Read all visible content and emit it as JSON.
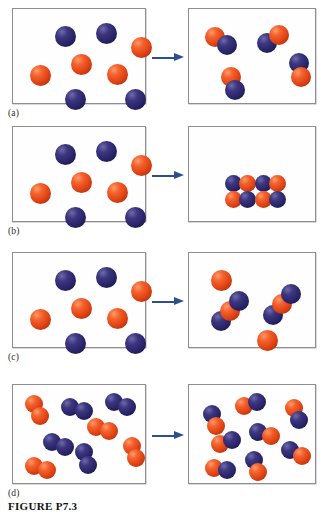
{
  "figure": {
    "caption": "FIGURE P7.3",
    "caption_font_style": "bold-serif",
    "background_color": "#ffffff",
    "box_border_color": "#8d8d93",
    "arrow_color": "#2d4f8e",
    "atom_colors": {
      "red": "#e04315",
      "blue": "#2a2568"
    },
    "atom_legend": [
      {
        "key": "red",
        "label": "red atom",
        "color": "#e04315"
      },
      {
        "key": "blue",
        "label": "blue atom",
        "color": "#2a2568"
      }
    ]
  },
  "panels": [
    {
      "id": "a",
      "label": "(a)",
      "arrow_label": "reacts to form",
      "reactants": {
        "box_name": "reactant-box-a",
        "description": "four free red atoms and four free blue atoms",
        "species": [
          {
            "formula": "red atom",
            "count": 4
          },
          {
            "formula": "blue atom",
            "count": 4
          }
        ],
        "atoms": [
          {
            "color": "blue",
            "x": 42,
            "y": 17,
            "r": 10.5
          },
          {
            "color": "blue",
            "x": 83,
            "y": 14,
            "r": 10.5
          },
          {
            "color": "red",
            "x": 118,
            "y": 28,
            "r": 10.5
          },
          {
            "color": "red",
            "x": 58,
            "y": 45,
            "r": 10.5
          },
          {
            "color": "red",
            "x": 17,
            "y": 56,
            "r": 10.5
          },
          {
            "color": "red",
            "x": 94,
            "y": 55,
            "r": 10.5
          },
          {
            "color": "blue",
            "x": 52,
            "y": 80,
            "r": 10.5
          },
          {
            "color": "blue",
            "x": 112,
            "y": 80,
            "r": 10.5
          }
        ]
      },
      "products": {
        "box_name": "product-box-a",
        "description": "four diatomic molecules, each one red atom bonded to one blue atom",
        "species": [
          {
            "formula": "red-blue diatomic molecule",
            "count": 4
          }
        ],
        "molecules": [
          {
            "type": "diatomic",
            "atoms": [
              {
                "color": "red",
                "x": 16,
                "y": 18,
                "r": 10
              },
              {
                "color": "blue",
                "x": 28,
                "y": 26,
                "r": 10
              }
            ]
          },
          {
            "type": "diatomic",
            "atoms": [
              {
                "color": "blue",
                "x": 68,
                "y": 24,
                "r": 10
              },
              {
                "color": "red",
                "x": 80,
                "y": 16,
                "r": 10
              }
            ]
          },
          {
            "type": "diatomic",
            "atoms": [
              {
                "color": "blue",
                "x": 100,
                "y": 44,
                "r": 10
              },
              {
                "color": "red",
                "x": 102,
                "y": 58,
                "r": 10
              }
            ]
          },
          {
            "type": "diatomic",
            "atoms": [
              {
                "color": "red",
                "x": 32,
                "y": 58,
                "r": 10
              },
              {
                "color": "blue",
                "x": 36,
                "y": 71,
                "r": 10
              }
            ]
          }
        ]
      }
    },
    {
      "id": "b",
      "label": "(b)",
      "arrow_label": "reacts to form",
      "reactants": {
        "box_name": "reactant-box-b",
        "description": "four free red atoms and four free blue atoms",
        "species": [
          {
            "formula": "red atom",
            "count": 4
          },
          {
            "formula": "blue atom",
            "count": 4
          }
        ],
        "atoms": [
          {
            "color": "blue",
            "x": 42,
            "y": 17,
            "r": 10.5
          },
          {
            "color": "blue",
            "x": 83,
            "y": 14,
            "r": 10.5
          },
          {
            "color": "red",
            "x": 118,
            "y": 28,
            "r": 10.5
          },
          {
            "color": "red",
            "x": 58,
            "y": 45,
            "r": 10.5
          },
          {
            "color": "red",
            "x": 17,
            "y": 56,
            "r": 10.5
          },
          {
            "color": "red",
            "x": 94,
            "y": 55,
            "r": 10.5
          },
          {
            "color": "blue",
            "x": 52,
            "y": 80,
            "r": 10.5
          },
          {
            "color": "blue",
            "x": 112,
            "y": 80,
            "r": 10.5
          }
        ]
      },
      "products": {
        "box_name": "product-box-b",
        "description": "a single ionic solid cluster of eight atoms arranged as a two by two grid of red-blue pairs resting at the bottom of the box",
        "species": [
          {
            "formula": "ionic solid cluster (4 red + 4 blue)",
            "count": 1
          }
        ],
        "cluster": {
          "origin_x": 36,
          "origin_y": 48,
          "atom_radius": 8.5,
          "atoms": [
            {
              "color": "blue",
              "x": 36,
              "y": 48
            },
            {
              "color": "red",
              "x": 50,
              "y": 48
            },
            {
              "color": "blue",
              "x": 66,
              "y": 48
            },
            {
              "color": "red",
              "x": 80,
              "y": 48
            },
            {
              "color": "red",
              "x": 36,
              "y": 64
            },
            {
              "color": "blue",
              "x": 50,
              "y": 64
            },
            {
              "color": "red",
              "x": 66,
              "y": 64
            },
            {
              "color": "blue",
              "x": 80,
              "y": 64
            }
          ]
        }
      }
    },
    {
      "id": "c",
      "label": "(c)",
      "arrow_label": "reacts to form",
      "reactants": {
        "box_name": "reactant-box-c",
        "description": "four free red atoms and four free blue atoms",
        "species": [
          {
            "formula": "red atom",
            "count": 4
          },
          {
            "formula": "blue atom",
            "count": 4
          }
        ],
        "atoms": [
          {
            "color": "blue",
            "x": 42,
            "y": 17,
            "r": 10.5
          },
          {
            "color": "blue",
            "x": 83,
            "y": 14,
            "r": 10.5
          },
          {
            "color": "red",
            "x": 118,
            "y": 28,
            "r": 10.5
          },
          {
            "color": "red",
            "x": 58,
            "y": 45,
            "r": 10.5
          },
          {
            "color": "red",
            "x": 17,
            "y": 56,
            "r": 10.5
          },
          {
            "color": "red",
            "x": 94,
            "y": 55,
            "r": 10.5
          },
          {
            "color": "blue",
            "x": 52,
            "y": 80,
            "r": 10.5
          },
          {
            "color": "blue",
            "x": 112,
            "y": 80,
            "r": 10.5
          }
        ]
      },
      "products": {
        "box_name": "product-box-c",
        "description": "two triatomic molecules, each blue-red-blue, plus two leftover free red atoms",
        "species": [
          {
            "formula": "blue-red-blue triatomic molecule",
            "count": 2
          },
          {
            "formula": "red atom",
            "count": 2
          }
        ],
        "molecules": [
          {
            "type": "triatomic",
            "atoms": [
              {
                "color": "blue",
                "x": 22,
                "y": 58,
                "r": 10
              },
              {
                "color": "red",
                "x": 31,
                "y": 48,
                "r": 10
              },
              {
                "color": "blue",
                "x": 40,
                "y": 38,
                "r": 10
              }
            ]
          },
          {
            "type": "triatomic",
            "atoms": [
              {
                "color": "blue",
                "x": 74,
                "y": 52,
                "r": 10
              },
              {
                "color": "red",
                "x": 83,
                "y": 41,
                "r": 10
              },
              {
                "color": "blue",
                "x": 92,
                "y": 31,
                "r": 10
              }
            ]
          }
        ],
        "free_atoms": [
          {
            "color": "red",
            "x": 22,
            "y": 17,
            "r": 10.5
          },
          {
            "color": "red",
            "x": 68,
            "y": 77,
            "r": 10.5
          }
        ]
      }
    },
    {
      "id": "d",
      "label": "(d)",
      "arrow_label": "reacts to form",
      "reactants": {
        "box_name": "reactant-box-d",
        "description": "four red diatomic molecules and four blue diatomic molecules",
        "species": [
          {
            "formula": "red-red diatomic molecule",
            "count": 4
          },
          {
            "formula": "blue-blue diatomic molecule",
            "count": 4
          }
        ],
        "molecules": [
          {
            "type": "diatomic",
            "atoms": [
              {
                "color": "red",
                "x": 12,
                "y": 10,
                "r": 9
              },
              {
                "color": "red",
                "x": 18,
                "y": 22,
                "r": 9
              }
            ]
          },
          {
            "type": "diatomic",
            "atoms": [
              {
                "color": "blue",
                "x": 48,
                "y": 13,
                "r": 9
              },
              {
                "color": "blue",
                "x": 62,
                "y": 17,
                "r": 9
              }
            ]
          },
          {
            "type": "diatomic",
            "atoms": [
              {
                "color": "blue",
                "x": 92,
                "y": 8,
                "r": 9
              },
              {
                "color": "blue",
                "x": 105,
                "y": 13,
                "r": 9
              }
            ]
          },
          {
            "type": "diatomic",
            "atoms": [
              {
                "color": "red",
                "x": 74,
                "y": 33,
                "r": 9
              },
              {
                "color": "red",
                "x": 87,
                "y": 37,
                "r": 9
              }
            ]
          },
          {
            "type": "diatomic",
            "atoms": [
              {
                "color": "blue",
                "x": 30,
                "y": 48,
                "r": 9
              },
              {
                "color": "blue",
                "x": 43,
                "y": 53,
                "r": 9
              }
            ]
          },
          {
            "type": "diatomic",
            "atoms": [
              {
                "color": "red",
                "x": 110,
                "y": 52,
                "r": 9
              },
              {
                "color": "red",
                "x": 114,
                "y": 64,
                "r": 9
              }
            ]
          },
          {
            "type": "diatomic",
            "atoms": [
              {
                "color": "blue",
                "x": 62,
                "y": 58,
                "r": 9
              },
              {
                "color": "blue",
                "x": 66,
                "y": 71,
                "r": 9
              }
            ]
          },
          {
            "type": "diatomic",
            "atoms": [
              {
                "color": "red",
                "x": 12,
                "y": 72,
                "r": 9
              },
              {
                "color": "red",
                "x": 25,
                "y": 76,
                "r": 9
              }
            ]
          }
        ]
      },
      "products": {
        "box_name": "product-box-d",
        "description": "eight diatomic molecules, each one red atom bonded to one blue atom",
        "species": [
          {
            "formula": "red-blue diatomic molecule",
            "count": 8
          }
        ],
        "molecules": [
          {
            "type": "diatomic",
            "atoms": [
              {
                "color": "blue",
                "x": 14,
                "y": 20,
                "r": 9
              },
              {
                "color": "red",
                "x": 18,
                "y": 32,
                "r": 9
              }
            ]
          },
          {
            "type": "diatomic",
            "atoms": [
              {
                "color": "red",
                "x": 46,
                "y": 12,
                "r": 9
              },
              {
                "color": "blue",
                "x": 59,
                "y": 8,
                "r": 9
              }
            ]
          },
          {
            "type": "diatomic",
            "atoms": [
              {
                "color": "red",
                "x": 96,
                "y": 14,
                "r": 9
              },
              {
                "color": "blue",
                "x": 101,
                "y": 26,
                "r": 9
              }
            ]
          },
          {
            "type": "diatomic",
            "atoms": [
              {
                "color": "blue",
                "x": 60,
                "y": 38,
                "r": 9
              },
              {
                "color": "red",
                "x": 73,
                "y": 42,
                "r": 9
              }
            ]
          },
          {
            "type": "diatomic",
            "atoms": [
              {
                "color": "red",
                "x": 22,
                "y": 50,
                "r": 9
              },
              {
                "color": "blue",
                "x": 34,
                "y": 46,
                "r": 9
              }
            ]
          },
          {
            "type": "diatomic",
            "atoms": [
              {
                "color": "blue",
                "x": 92,
                "y": 56,
                "r": 9
              },
              {
                "color": "red",
                "x": 104,
                "y": 62,
                "r": 9
              }
            ]
          },
          {
            "type": "diatomic",
            "atoms": [
              {
                "color": "red",
                "x": 16,
                "y": 74,
                "r": 9
              },
              {
                "color": "blue",
                "x": 29,
                "y": 76,
                "r": 9
              }
            ]
          },
          {
            "type": "diatomic",
            "atoms": [
              {
                "color": "blue",
                "x": 56,
                "y": 66,
                "r": 9
              },
              {
                "color": "red",
                "x": 60,
                "y": 78,
                "r": 9
              }
            ]
          }
        ]
      }
    }
  ]
}
